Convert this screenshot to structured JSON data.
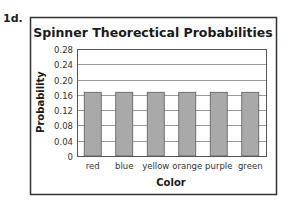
{
  "problem_label": "1d.",
  "chart_data": {
    "type": "bar",
    "title": "Spinner Theorectical Probabilities",
    "xlabel": "Color",
    "ylabel": "Probability",
    "categories": [
      "red",
      "blue",
      "yellow",
      "orange",
      "purple",
      "green"
    ],
    "values": [
      0.1667,
      0.1667,
      0.1667,
      0.1667,
      0.1667,
      0.1667
    ],
    "ylim": [
      0,
      0.28
    ],
    "yticks": [
      0,
      0.04,
      0.08,
      0.12,
      0.16,
      0.2,
      0.24,
      0.28
    ],
    "ytick_labels": [
      "0",
      "0.04",
      "0.08",
      "0.12",
      "0.16",
      "0.20",
      "0.24",
      "0.28"
    ],
    "grid": true,
    "legend": "none",
    "colors": {
      "bar_fill": "#a9a9a9",
      "bar_stroke": "#5a5a5a",
      "grid": "#9a9a9a",
      "frame": "#333333"
    }
  }
}
